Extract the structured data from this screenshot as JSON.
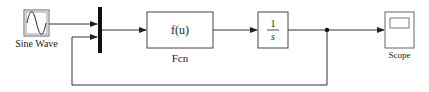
{
  "diagram": {
    "type": "simulink-block-diagram",
    "blocks": [
      {
        "id": "sine",
        "label": "Sine Wave",
        "kind": "source"
      },
      {
        "id": "mux",
        "label": "",
        "kind": "mux"
      },
      {
        "id": "fcn",
        "label": "Fcn",
        "content": "f(u)",
        "kind": "function"
      },
      {
        "id": "integrator",
        "label": "",
        "numerator": "1",
        "denominator": "s",
        "kind": "integrator"
      },
      {
        "id": "scope",
        "label": "Scope",
        "kind": "sink"
      }
    ],
    "connections": [
      {
        "from": "sine",
        "to": "mux",
        "port": 1
      },
      {
        "from": "mux",
        "to": "fcn"
      },
      {
        "from": "fcn",
        "to": "integrator"
      },
      {
        "from": "integrator",
        "to": "scope"
      },
      {
        "from": "integrator",
        "to": "mux",
        "port": 2,
        "note": "feedback"
      }
    ]
  }
}
